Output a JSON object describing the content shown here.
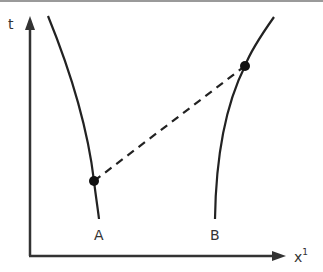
{
  "diagram": {
    "axes": {
      "y_label": "t",
      "x_label": "x",
      "x_label_superscript": "1"
    },
    "curves": [
      {
        "name": "A",
        "label": "A"
      },
      {
        "name": "B",
        "label": "B"
      }
    ],
    "points": [
      {
        "on_curve": "A",
        "x": 94,
        "y": 181
      },
      {
        "on_curve": "B",
        "x": 245,
        "y": 66
      }
    ],
    "tie_line": {
      "style": "dashed",
      "from": "A",
      "to": "B"
    },
    "colors": {
      "stroke": "#222222",
      "border": "#9a9a9a"
    }
  }
}
